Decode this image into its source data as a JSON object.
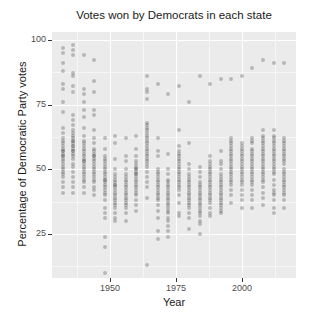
{
  "chart_data": {
    "type": "scatter",
    "title": "Votes won by Democrats in each state",
    "xlabel": "Year",
    "ylabel": "Percentage of Democratic Party votes",
    "xlim": [
      1928,
      2020.5
    ],
    "ylim": [
      8,
      103
    ],
    "x_ticks": [
      1950,
      1975,
      2000
    ],
    "y_ticks": [
      25,
      50,
      75,
      100
    ],
    "grid": true,
    "legend": "none",
    "series": [
      {
        "year": 1932,
        "values": [
          97,
          95,
          91,
          88,
          83,
          81,
          76,
          72,
          66,
          64,
          62,
          61,
          60,
          59,
          58,
          57,
          57,
          56,
          55,
          55,
          54,
          53,
          52,
          51,
          50,
          49,
          48,
          47,
          45,
          43,
          41
        ]
      },
      {
        "year": 1936,
        "values": [
          98,
          96,
          94,
          87,
          86,
          82,
          80,
          71,
          69,
          67,
          65,
          64,
          63,
          62,
          61,
          61,
          60,
          59,
          59,
          58,
          57,
          57,
          56,
          55,
          54,
          52,
          51,
          49,
          47,
          45,
          43,
          41
        ]
      },
      {
        "year": 1940,
        "values": [
          94,
          81,
          79,
          76,
          73,
          70,
          66,
          63,
          61,
          60,
          59,
          58,
          57,
          56,
          55,
          54,
          53,
          53,
          52,
          51,
          50,
          49,
          48,
          47,
          46,
          45,
          43,
          41
        ]
      },
      {
        "year": 1944,
        "values": [
          92,
          84,
          80,
          73,
          71,
          65,
          62,
          60,
          58,
          57,
          56,
          55,
          55,
          54,
          53,
          52,
          51,
          50,
          49,
          48,
          47,
          46,
          45,
          43,
          42,
          40
        ]
      },
      {
        "year": 1948,
        "values": [
          62,
          58,
          55,
          54,
          53,
          52,
          51,
          50,
          49,
          48,
          47,
          46,
          46,
          45,
          44,
          43,
          42,
          41,
          40,
          38,
          35,
          33,
          31,
          24,
          20,
          10
        ]
      },
      {
        "year": 1952,
        "values": [
          63,
          60,
          54,
          50,
          48,
          47,
          46,
          45,
          44,
          44,
          43,
          42,
          41,
          40,
          39,
          38,
          37,
          36,
          35,
          33,
          31,
          30
        ]
      },
      {
        "year": 1956,
        "values": [
          62,
          55,
          53,
          50,
          48,
          47,
          46,
          45,
          44,
          43,
          42,
          41,
          40,
          39,
          38,
          37,
          36,
          35,
          33,
          30
        ]
      },
      {
        "year": 1960,
        "values": [
          63,
          58,
          55,
          53,
          52,
          51,
          50,
          50,
          49,
          48,
          48,
          47,
          46,
          45,
          44,
          43,
          42,
          41,
          40,
          38,
          36,
          34
        ]
      },
      {
        "year": 1964,
        "values": [
          86,
          81,
          80,
          77,
          68,
          67,
          66,
          65,
          64,
          63,
          62,
          61,
          60,
          59,
          58,
          57,
          56,
          55,
          54,
          53,
          52,
          51,
          49,
          47,
          45,
          43,
          39,
          13
        ]
      },
      {
        "year": 1968,
        "values": [
          83,
          62,
          57,
          55,
          50,
          49,
          48,
          47,
          46,
          45,
          44,
          43,
          42,
          41,
          40,
          39,
          38,
          36,
          34,
          31,
          26,
          23
        ]
      },
      {
        "year": 1972,
        "values": [
          79,
          56,
          50,
          48,
          46,
          45,
          44,
          43,
          42,
          41,
          40,
          39,
          38,
          37,
          36,
          35,
          34,
          33,
          31,
          30,
          28,
          26,
          24
        ]
      },
      {
        "year": 1976,
        "values": [
          82,
          65,
          59,
          57,
          56,
          55,
          54,
          53,
          52,
          51,
          50,
          49,
          48,
          47,
          46,
          45,
          44,
          43,
          42,
          40,
          37,
          33,
          32
        ]
      },
      {
        "year": 1980,
        "values": [
          76,
          60,
          52,
          50,
          48,
          47,
          46,
          45,
          44,
          43,
          42,
          41,
          40,
          39,
          38,
          37,
          36,
          35,
          33,
          31,
          27
        ]
      },
      {
        "year": 1984,
        "values": [
          86,
          51,
          49,
          47,
          45,
          44,
          43,
          42,
          41,
          40,
          39,
          38,
          37,
          36,
          35,
          34,
          33,
          32,
          30,
          29,
          25
        ]
      },
      {
        "year": 1988,
        "values": [
          83,
          55,
          53,
          52,
          51,
          50,
          49,
          48,
          47,
          46,
          45,
          44,
          43,
          42,
          41,
          40,
          39,
          38,
          37,
          35,
          33,
          32
        ]
      },
      {
        "year": 1992,
        "values": [
          85,
          57,
          53,
          52,
          50,
          48,
          47,
          46,
          45,
          44,
          43,
          42,
          41,
          40,
          39,
          38,
          37,
          36,
          35,
          34,
          33
        ]
      },
      {
        "year": 1996,
        "values": [
          85,
          62,
          61,
          60,
          59,
          58,
          57,
          56,
          55,
          54,
          53,
          52,
          51,
          50,
          49,
          48,
          47,
          46,
          45,
          44,
          42,
          40,
          37
        ]
      },
      {
        "year": 2000,
        "values": [
          86,
          60,
          59,
          58,
          57,
          56,
          55,
          54,
          53,
          52,
          51,
          50,
          49,
          48,
          47,
          46,
          45,
          44,
          42,
          40,
          38,
          35
        ]
      },
      {
        "year": 2004,
        "values": [
          89,
          62,
          61,
          60,
          58,
          57,
          56,
          55,
          54,
          53,
          52,
          51,
          50,
          49,
          48,
          47,
          46,
          45,
          44,
          42,
          40,
          38,
          35
        ]
      },
      {
        "year": 2008,
        "values": [
          92,
          65,
          63,
          62,
          61,
          60,
          59,
          58,
          57,
          56,
          55,
          54,
          53,
          52,
          51,
          50,
          49,
          48,
          47,
          46,
          45,
          43,
          41,
          39,
          36
        ]
      },
      {
        "year": 2012,
        "values": [
          91,
          65,
          63,
          62,
          61,
          60,
          59,
          58,
          57,
          56,
          55,
          54,
          53,
          52,
          51,
          50,
          49,
          48,
          46,
          44,
          42,
          41,
          40,
          38,
          35,
          33
        ]
      },
      {
        "year": 2016,
        "values": [
          91,
          62,
          61,
          60,
          59,
          58,
          57,
          56,
          55,
          54,
          53,
          52,
          50,
          49,
          48,
          47,
          46,
          45,
          44,
          43,
          42,
          41,
          40,
          38,
          35
        ]
      }
    ]
  },
  "colors": {
    "panel_bg": "#ebebeb",
    "grid": "#ffffff",
    "point": "rgba(85,85,85,0.35)"
  }
}
